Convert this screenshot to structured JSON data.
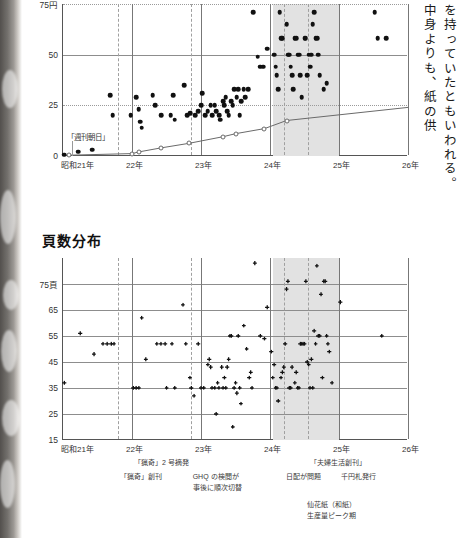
{
  "page": {
    "width": 459,
    "height": 538,
    "background": "#ffffff"
  },
  "body_text": {
    "column_right": "を持っていたともいわれる。",
    "column_left": "中身よりも、紙の供"
  },
  "colors": {
    "dot": "#111111",
    "trend_line": "#6a6a6a",
    "band": "#e2e2e2",
    "axis": "#555555",
    "gridline": "#8d8d8d",
    "dashed_gridline": "#a0a0a0"
  },
  "chart_data": [
    {
      "id": "price-distribution",
      "type": "scatter",
      "title": "",
      "xlabel": "",
      "ylabel": "円",
      "xlim": [
        1946.0,
        1951.0
      ],
      "ylim": [
        0,
        75
      ],
      "xticks": [
        1946,
        1947,
        1948,
        1949,
        1950,
        1951
      ],
      "xticklabels": [
        "昭和21年",
        "22年",
        "23年",
        "24年",
        "25年",
        "26年"
      ],
      "yticks": [
        0,
        25,
        50,
        75
      ],
      "yticklabels": [
        "0",
        "25",
        "50",
        "75円"
      ],
      "grid": true,
      "shaded_span": {
        "from": 1949.05,
        "to": 1950.0,
        "label": "仙花紙（和紙）生産量ピーク期"
      },
      "dashed_verticals": [
        1946.8,
        1947.85,
        1949.2,
        1949.55
      ],
      "annotation": {
        "text": "「週刊朝日」",
        "x": 1946.12,
        "y": 9.5
      },
      "series": [
        {
          "name": "雑誌定価（円）",
          "marker": "filled-circle",
          "points": [
            [
              1946.02,
              0.6
            ],
            [
              1946.22,
              2.2
            ],
            [
              1946.42,
              3.2
            ],
            [
              1946.68,
              30
            ],
            [
              1946.72,
              20
            ],
            [
              1946.98,
              20
            ],
            [
              1947.06,
              29
            ],
            [
              1947.1,
              23
            ],
            [
              1947.12,
              17
            ],
            [
              1947.14,
              14
            ],
            [
              1947.3,
              30
            ],
            [
              1947.34,
              25
            ],
            [
              1947.42,
              20
            ],
            [
              1947.56,
              20
            ],
            [
              1947.6,
              30
            ],
            [
              1947.62,
              18
            ],
            [
              1947.76,
              35
            ],
            [
              1947.8,
              20
            ],
            [
              1947.84,
              21
            ],
            [
              1947.92,
              20
            ],
            [
              1947.96,
              22
            ],
            [
              1948.0,
              25
            ],
            [
              1948.02,
              31
            ],
            [
              1948.06,
              20
            ],
            [
              1948.1,
              22
            ],
            [
              1948.14,
              25
            ],
            [
              1948.16,
              20
            ],
            [
              1948.2,
              25
            ],
            [
              1948.22,
              22
            ],
            [
              1948.26,
              20
            ],
            [
              1948.28,
              18
            ],
            [
              1948.32,
              27
            ],
            [
              1948.34,
              25
            ],
            [
              1948.36,
              29
            ],
            [
              1948.38,
              22
            ],
            [
              1948.4,
              20
            ],
            [
              1948.44,
              27
            ],
            [
              1948.46,
              25
            ],
            [
              1948.48,
              33
            ],
            [
              1948.52,
              29
            ],
            [
              1948.54,
              33
            ],
            [
              1948.56,
              20
            ],
            [
              1948.58,
              27
            ],
            [
              1948.62,
              33
            ],
            [
              1948.64,
              29
            ],
            [
              1948.68,
              33
            ],
            [
              1948.76,
              71
            ],
            [
              1948.82,
              49
            ],
            [
              1948.86,
              44
            ],
            [
              1948.9,
              44
            ],
            [
              1948.96,
              53
            ],
            [
              1949.06,
              50
            ],
            [
              1949.08,
              44
            ],
            [
              1949.1,
              40
            ],
            [
              1949.12,
              33
            ],
            [
              1949.14,
              71
            ],
            [
              1949.16,
              58
            ],
            [
              1949.18,
              58
            ],
            [
              1949.24,
              65
            ],
            [
              1949.26,
              50
            ],
            [
              1949.28,
              50
            ],
            [
              1949.3,
              44
            ],
            [
              1949.32,
              40
            ],
            [
              1949.34,
              33
            ],
            [
              1949.36,
              58
            ],
            [
              1949.38,
              58
            ],
            [
              1949.4,
              50
            ],
            [
              1949.42,
              50
            ],
            [
              1949.44,
              40
            ],
            [
              1949.46,
              29
            ],
            [
              1949.5,
              58
            ],
            [
              1949.52,
              58
            ],
            [
              1949.54,
              40
            ],
            [
              1949.56,
              50
            ],
            [
              1949.58,
              44
            ],
            [
              1949.6,
              50
            ],
            [
              1949.62,
              65
            ],
            [
              1949.64,
              71
            ],
            [
              1949.66,
              58
            ],
            [
              1949.68,
              58
            ],
            [
              1949.7,
              50
            ],
            [
              1949.72,
              40
            ],
            [
              1949.78,
              33
            ],
            [
              1949.82,
              36
            ],
            [
              1950.52,
              71
            ],
            [
              1950.56,
              58
            ],
            [
              1950.68,
              58
            ]
          ]
        },
        {
          "name": "基準価格推移",
          "marker": "open-circle-line",
          "points": [
            [
              1946.08,
              0.4
            ],
            [
              1947.0,
              1.2
            ],
            [
              1947.1,
              2.0
            ],
            [
              1947.42,
              4.0
            ],
            [
              1947.82,
              6.2
            ],
            [
              1948.32,
              9.5
            ],
            [
              1948.5,
              11.0
            ],
            [
              1948.92,
              13.5
            ],
            [
              1949.24,
              17.5
            ],
            [
              1951.0,
              24.0
            ]
          ]
        }
      ]
    },
    {
      "id": "page-count-distribution",
      "type": "scatter",
      "title": "頁数分布",
      "xlabel": "",
      "ylabel": "頁",
      "xlim": [
        1946.0,
        1951.0
      ],
      "ylim": [
        15,
        85
      ],
      "xticks": [
        1946,
        1947,
        1948,
        1949,
        1950,
        1951
      ],
      "xticklabels": [
        "昭和21年",
        "22年",
        "23年",
        "24年",
        "25年",
        "26年"
      ],
      "yticks": [
        15,
        25,
        35,
        45,
        55,
        65,
        75
      ],
      "yticklabels": [
        "15",
        "25",
        "35",
        "45",
        "55",
        "65",
        "75頁"
      ],
      "grid": true,
      "shaded_span": {
        "from": 1949.05,
        "to": 1950.0,
        "label": "仙花紙（和紙）生産量ピーク期"
      },
      "dashed_verticals": [
        1946.8,
        1947.85,
        1949.2,
        1949.55
      ],
      "series": [
        {
          "name": "頁数",
          "marker": "filled-plus",
          "points": [
            [
              1946.02,
              37
            ],
            [
              1946.25,
              56
            ],
            [
              1946.45,
              48
            ],
            [
              1946.58,
              52
            ],
            [
              1946.64,
              52
            ],
            [
              1946.7,
              52
            ],
            [
              1946.74,
              52
            ],
            [
              1947.02,
              35
            ],
            [
              1947.06,
              35
            ],
            [
              1947.1,
              35
            ],
            [
              1947.14,
              62
            ],
            [
              1947.2,
              46
            ],
            [
              1947.36,
              52
            ],
            [
              1947.42,
              52
            ],
            [
              1947.48,
              52
            ],
            [
              1947.5,
              35
            ],
            [
              1947.58,
              52
            ],
            [
              1947.62,
              35
            ],
            [
              1947.74,
              67
            ],
            [
              1947.78,
              52
            ],
            [
              1947.84,
              39
            ],
            [
              1947.86,
              35
            ],
            [
              1947.9,
              32
            ],
            [
              1947.96,
              52
            ],
            [
              1948.0,
              35
            ],
            [
              1948.04,
              35
            ],
            [
              1948.1,
              44
            ],
            [
              1948.12,
              46
            ],
            [
              1948.14,
              43
            ],
            [
              1948.16,
              35
            ],
            [
              1948.2,
              35
            ],
            [
              1948.22,
              25
            ],
            [
              1948.24,
              37
            ],
            [
              1948.26,
              35
            ],
            [
              1948.3,
              43
            ],
            [
              1948.32,
              35
            ],
            [
              1948.34,
              39
            ],
            [
              1948.36,
              35
            ],
            [
              1948.38,
              43
            ],
            [
              1948.4,
              46
            ],
            [
              1948.42,
              55
            ],
            [
              1948.44,
              55
            ],
            [
              1948.46,
              20
            ],
            [
              1948.48,
              35
            ],
            [
              1948.5,
              37
            ],
            [
              1948.52,
              33
            ],
            [
              1948.54,
              55
            ],
            [
              1948.56,
              35
            ],
            [
              1948.58,
              29
            ],
            [
              1948.62,
              59
            ],
            [
              1948.66,
              50
            ],
            [
              1948.7,
              39
            ],
            [
              1948.72,
              41
            ],
            [
              1948.74,
              35
            ],
            [
              1948.78,
              83
            ],
            [
              1948.86,
              55
            ],
            [
              1948.92,
              54
            ],
            [
              1948.96,
              66
            ],
            [
              1949.02,
              49
            ],
            [
              1949.04,
              39
            ],
            [
              1949.06,
              44
            ],
            [
              1949.08,
              35
            ],
            [
              1949.1,
              35
            ],
            [
              1949.12,
              30
            ],
            [
              1949.16,
              39
            ],
            [
              1949.18,
              41
            ],
            [
              1949.2,
              43
            ],
            [
              1949.22,
              52
            ],
            [
              1949.24,
              73
            ],
            [
              1949.26,
              76
            ],
            [
              1949.28,
              35
            ],
            [
              1949.3,
              35
            ],
            [
              1949.32,
              43
            ],
            [
              1949.36,
              37
            ],
            [
              1949.38,
              41
            ],
            [
              1949.4,
              35
            ],
            [
              1949.42,
              35
            ],
            [
              1949.44,
              52
            ],
            [
              1949.46,
              52
            ],
            [
              1949.48,
              52
            ],
            [
              1949.5,
              52
            ],
            [
              1949.52,
              76
            ],
            [
              1949.54,
              45
            ],
            [
              1949.56,
              44
            ],
            [
              1949.58,
              35
            ],
            [
              1949.6,
              46
            ],
            [
              1949.62,
              35
            ],
            [
              1949.64,
              57
            ],
            [
              1949.66,
              52
            ],
            [
              1949.68,
              82
            ],
            [
              1949.7,
              55
            ],
            [
              1949.72,
              55
            ],
            [
              1949.74,
              71
            ],
            [
              1949.76,
              39
            ],
            [
              1949.78,
              76
            ],
            [
              1949.8,
              76
            ],
            [
              1949.82,
              55
            ],
            [
              1949.84,
              52
            ],
            [
              1949.86,
              49
            ],
            [
              1949.9,
              37
            ],
            [
              1950.02,
              68
            ],
            [
              1950.62,
              55
            ]
          ]
        }
      ]
    }
  ],
  "annotations": [
    {
      "id": "ryoki-issue2",
      "text": "「猟奇」2 号摘発",
      "x": 1947.0,
      "row": 0
    },
    {
      "id": "ryoki-launch",
      "text": "「猟奇」創刊",
      "x": 1946.8,
      "row": 1
    },
    {
      "id": "ghq-censorship",
      "text": "GHQ の検閲が\n事後に順次切替",
      "x": 1947.85,
      "row": 1
    },
    {
      "id": "fufuseikatsu-launch",
      "text": "「夫婦生活創刊」",
      "x": 1949.55,
      "row": 0
    },
    {
      "id": "nippai-problem",
      "text": "日配が問題",
      "x": 1949.2,
      "row": 1
    },
    {
      "id": "thousand-yen-note",
      "text": "千円札発行",
      "x": 1950.0,
      "row": 1
    },
    {
      "id": "senkashi-peak",
      "text": "仙花紙（和紙）\n生産量ピーク期",
      "x": 1949.5,
      "row": 2
    }
  ]
}
